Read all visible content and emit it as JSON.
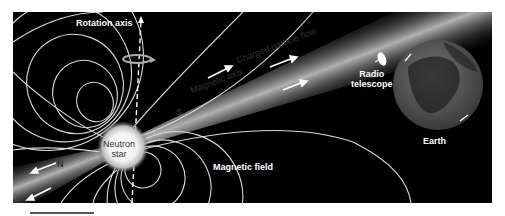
{
  "figure": {
    "labels": {
      "rotation_axis": "Rotation axis",
      "charged_particle_flow": "Charged particle flow",
      "magnetic_axis": "Magnetic axis",
      "radio_telescope_line1": "Radio",
      "radio_telescope_line2": "telescope",
      "neutron_star_line1": "Neutron",
      "neutron_star_line2": "star",
      "magnetic_field": "Magnetic field",
      "earth": "Earth",
      "south_pole": "S",
      "north_pole": "N"
    },
    "colors": {
      "background": "#000000",
      "field_lines": "#d9d9d9",
      "beam": "#bfbfbf",
      "star_core": "#ffffff",
      "earth_land": "#6b6b6b",
      "earth_ocean": "#2a2a2a"
    }
  }
}
